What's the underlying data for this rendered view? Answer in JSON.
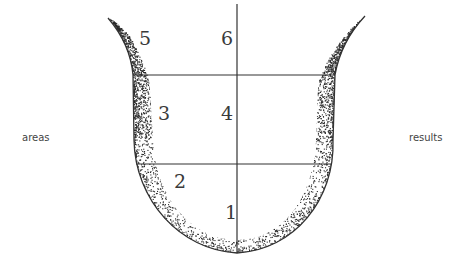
{
  "diagram": {
    "left_label": "areas",
    "right_label": "results",
    "regions": [
      {
        "id": 1,
        "label": "1",
        "x": 231,
        "y": 219
      },
      {
        "id": 2,
        "label": "2",
        "x": 181,
        "y": 188
      },
      {
        "id": 3,
        "label": "3",
        "x": 165,
        "y": 120
      },
      {
        "id": 4,
        "label": "4",
        "x": 228,
        "y": 120
      },
      {
        "id": 5,
        "label": "5",
        "x": 146,
        "y": 45
      },
      {
        "id": 6,
        "label": "6",
        "x": 228,
        "y": 45
      }
    ],
    "colors": {
      "stroke": "#333333",
      "stipple": "#2a2a2a",
      "text": "#3a3a3a",
      "background": "#ffffff"
    }
  }
}
